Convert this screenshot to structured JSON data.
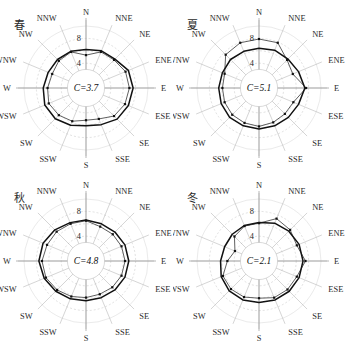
{
  "figure": {
    "top_partial_text": "",
    "panel_order": [
      "spring",
      "summer",
      "autumn",
      "winter"
    ]
  },
  "directions": [
    "N",
    "NNE",
    "NE",
    "ENE",
    "E",
    "ESE",
    "SE",
    "SSE",
    "S",
    "SSW",
    "SW",
    "WSW",
    "W",
    "WNW",
    "NW",
    "NNW"
  ],
  "radial_ticks": [
    "4",
    "8"
  ],
  "colors": {
    "grid": "#b9b9b9",
    "spoke": "#9a9a9a",
    "series_thick": "#111111",
    "series_thin": "#1a1a1a",
    "text": "#2a2a2a"
  },
  "chart_data": [
    {
      "type": "radar",
      "id": "spring",
      "title": "春",
      "center_label": "C=3.7",
      "center_value": 3.7,
      "rlim": [
        0,
        10
      ],
      "rticks": [
        4,
        8
      ],
      "grid": true,
      "legend": "none",
      "categories": [
        "N",
        "NNE",
        "NE",
        "ENE",
        "E",
        "ESE",
        "SE",
        "SSE",
        "S",
        "SSW",
        "SW",
        "WSW",
        "W",
        "WNW",
        "NW",
        "NNW"
      ],
      "series": [
        {
          "name": "frequency",
          "values": [
            6.2,
            6.5,
            6.6,
            7.4,
            7.6,
            7.4,
            7.1,
            6.4,
            6.1,
            6.5,
            7.0,
            7.2,
            6.9,
            6.6,
            6.5,
            6.4
          ]
        },
        {
          "name": "speed",
          "values": [
            5.3,
            6.3,
            6.4,
            6.9,
            7.0,
            6.8,
            6.4,
            5.4,
            5.2,
            5.8,
            6.2,
            6.5,
            6.2,
            5.9,
            6.2,
            6.3
          ]
        }
      ],
      "xlabel": "",
      "ylabel": ""
    },
    {
      "type": "radar",
      "id": "summer",
      "title": "夏",
      "center_label": "C=5.1",
      "center_value": 5.1,
      "rlim": [
        0,
        10
      ],
      "rticks": [
        4,
        8
      ],
      "grid": true,
      "legend": "none",
      "categories": [
        "N",
        "NNE",
        "NE",
        "ENE",
        "E",
        "ESE",
        "SE",
        "SSE",
        "S",
        "SSW",
        "SW",
        "WSW",
        "W",
        "WNW",
        "NW",
        "NNW"
      ],
      "series": [
        {
          "name": "frequency",
          "values": [
            6.4,
            6.6,
            6.6,
            6.9,
            7.4,
            6.9,
            6.7,
            6.6,
            6.6,
            6.6,
            6.7,
            6.6,
            6.5,
            6.4,
            6.5,
            6.4
          ]
        },
        {
          "name": "speed",
          "values": [
            7.9,
            7.9,
            6.4,
            5.9,
            7.6,
            6.0,
            5.9,
            6.0,
            6.2,
            6.1,
            6.1,
            6.0,
            5.9,
            6.0,
            7.6,
            7.9
          ]
        }
      ],
      "xlabel": "",
      "ylabel": ""
    },
    {
      "type": "radar",
      "id": "autumn",
      "title": "秋",
      "center_label": "C=4.8",
      "center_value": 4.8,
      "rlim": [
        0,
        10
      ],
      "rticks": [
        4,
        8
      ],
      "grid": true,
      "legend": "none",
      "categories": [
        "N",
        "NNE",
        "NE",
        "ENE",
        "E",
        "ESE",
        "SE",
        "SSE",
        "S",
        "SSW",
        "SW",
        "WSW",
        "W",
        "WNW",
        "NW",
        "NNW"
      ],
      "series": [
        {
          "name": "frequency",
          "values": [
            6.6,
            6.5,
            6.6,
            6.8,
            6.9,
            6.8,
            6.6,
            6.4,
            6.4,
            6.6,
            6.9,
            7.3,
            7.6,
            7.5,
            7.1,
            6.7
          ]
        },
        {
          "name": "speed",
          "values": [
            6.5,
            6.0,
            6.1,
            6.2,
            6.3,
            6.2,
            6.0,
            5.8,
            5.9,
            6.2,
            6.6,
            7.0,
            7.1,
            6.8,
            6.7,
            6.5
          ]
        }
      ],
      "xlabel": "",
      "ylabel": ""
    },
    {
      "type": "radar",
      "id": "winter",
      "title": "冬",
      "center_label": "C=2.1",
      "center_value": 2.1,
      "rlim": [
        0,
        10
      ],
      "rticks": [
        4,
        8
      ],
      "grid": true,
      "legend": "none",
      "categories": [
        "N",
        "NNE",
        "NE",
        "ENE",
        "E",
        "ESE",
        "SE",
        "SSE",
        "S",
        "SSW",
        "SW",
        "WSW",
        "W",
        "WNW",
        "NW",
        "NNW"
      ],
      "series": [
        {
          "name": "frequency",
          "values": [
            6.2,
            6.6,
            6.8,
            7.0,
            7.1,
            7.0,
            6.9,
            6.8,
            6.7,
            6.8,
            6.8,
            6.6,
            6.2,
            6.0,
            6.1,
            6.2
          ]
        },
        {
          "name": "speed",
          "values": [
            6.1,
            7.4,
            7.1,
            6.6,
            7.5,
            6.6,
            6.5,
            6.4,
            6.0,
            6.3,
            6.4,
            6.3,
            5.1,
            4.2,
            5.6,
            6.1
          ]
        }
      ],
      "xlabel": "",
      "ylabel": ""
    }
  ]
}
